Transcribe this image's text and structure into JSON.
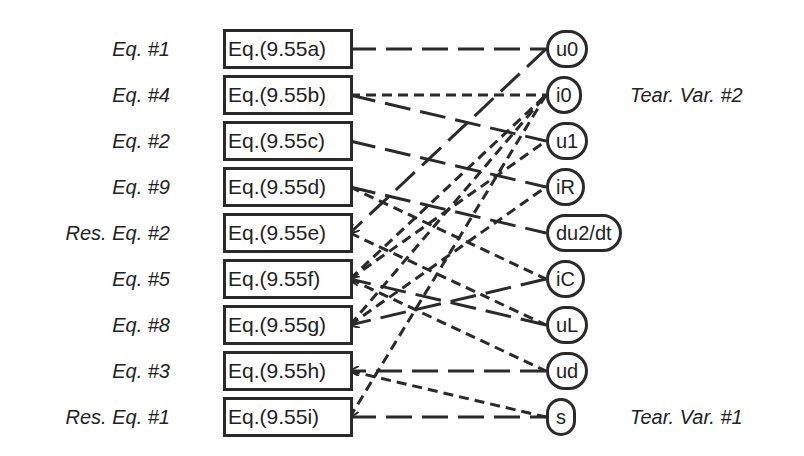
{
  "equations": [
    {
      "id": "a",
      "label": "Eq. #1",
      "box": "Eq.(9.55a)",
      "y": 49
    },
    {
      "id": "b",
      "label": "Eq. #4",
      "box": "Eq.(9.55b)",
      "y": 95
    },
    {
      "id": "c",
      "label": "Eq. #2",
      "box": "Eq.(9.55c)",
      "y": 141
    },
    {
      "id": "d",
      "label": "Eq. #9",
      "box": "Eq.(9.55d)",
      "y": 187
    },
    {
      "id": "e",
      "label": "Res. Eq. #2",
      "box": "Eq.(9.55e)",
      "y": 233
    },
    {
      "id": "f",
      "label": "Eq. #5",
      "box": "Eq.(9.55f)",
      "y": 279
    },
    {
      "id": "g",
      "label": "Eq. #8",
      "box": "Eq.(9.55g)",
      "y": 325
    },
    {
      "id": "h",
      "label": "Eq. #3",
      "box": "Eq.(9.55h)",
      "y": 371
    },
    {
      "id": "i",
      "label": "Res. Eq. #1",
      "box": "Eq.(9.55i)",
      "y": 417
    }
  ],
  "variables": [
    {
      "id": "u0",
      "label": "u0",
      "y": 49
    },
    {
      "id": "i0",
      "label": "i0",
      "y": 95
    },
    {
      "id": "u1",
      "label": "u1",
      "y": 141
    },
    {
      "id": "iR",
      "label": "iR",
      "y": 187
    },
    {
      "id": "du2dt",
      "label": "du2/dt",
      "y": 233
    },
    {
      "id": "iC",
      "label": "iC",
      "y": 279
    },
    {
      "id": "uL",
      "label": "uL",
      "y": 325
    },
    {
      "id": "ud",
      "label": "ud",
      "y": 371
    },
    {
      "id": "s",
      "label": "s",
      "y": 417
    }
  ],
  "annotations": {
    "tear_var_2": "Tear. Var. #2",
    "tear_var_1": "Tear. Var. #1"
  },
  "edges": [
    {
      "from": "a",
      "to": "u0",
      "style": "long"
    },
    {
      "from": "b",
      "to": "i0",
      "style": "short"
    },
    {
      "from": "b",
      "to": "u1",
      "style": "long"
    },
    {
      "from": "c",
      "to": "iR",
      "style": "long"
    },
    {
      "from": "d",
      "to": "du2dt",
      "style": "long"
    },
    {
      "from": "d",
      "to": "iC",
      "style": "short"
    },
    {
      "from": "e",
      "to": "u0",
      "style": "long",
      "arrow": "eq"
    },
    {
      "from": "e",
      "to": "uL",
      "style": "short"
    },
    {
      "from": "f",
      "to": "i0",
      "style": "short"
    },
    {
      "from": "f",
      "to": "u1",
      "style": "short"
    },
    {
      "from": "f",
      "to": "uL",
      "style": "long",
      "arrow": "eq"
    },
    {
      "from": "f",
      "to": "ud",
      "style": "short"
    },
    {
      "from": "g",
      "to": "i0",
      "style": "short"
    },
    {
      "from": "g",
      "to": "iR",
      "style": "short"
    },
    {
      "from": "g",
      "to": "iC",
      "style": "long",
      "arrow": "eq"
    },
    {
      "from": "h",
      "to": "ud",
      "style": "long",
      "arrow": "eq"
    },
    {
      "from": "h",
      "to": "s",
      "style": "short"
    },
    {
      "from": "i",
      "to": "i0",
      "style": "short",
      "arrow": "eq"
    },
    {
      "from": "i",
      "to": "s",
      "style": "long"
    }
  ]
}
